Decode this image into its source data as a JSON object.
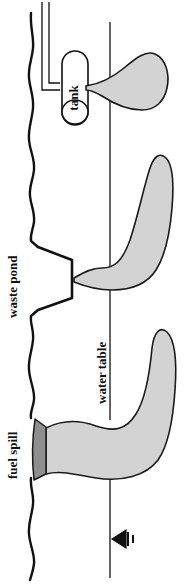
{
  "figure": {
    "orientation": "rotated-90-ccw",
    "background_color": "#ffffff",
    "labels": {
      "tank": "tank",
      "waste_pond": "waste pond",
      "water_table": "water table",
      "fuel_spill": "fuel spill"
    },
    "colors": {
      "plume_fill": "#d3d3d3",
      "spill_fill": "#8e8e8e",
      "line": "#111111",
      "background": "#ffffff"
    },
    "features": [
      {
        "name": "ground-surface",
        "type": "wavy-line",
        "description": "irregular land surface running the full height of the figure"
      },
      {
        "name": "vent-pipe",
        "type": "double-line",
        "description": "narrow pipe entering from the figure edge and hooking into the tank"
      },
      {
        "name": "tank",
        "type": "cylinder",
        "label": "tank",
        "description": "buried storage tank drawn as a rounded cylinder"
      },
      {
        "name": "waste-pond",
        "type": "trapezoid",
        "label": "waste pond",
        "description": "surface impoundment cross-section cut into the ground line"
      },
      {
        "name": "fuel-spill",
        "type": "wedge",
        "label": "fuel spill",
        "fill": "#8e8e8e",
        "description": "dark narrow wedge of spilled fuel at the ground surface"
      },
      {
        "name": "water-table",
        "type": "line",
        "label": "water table",
        "description": "thin straight line marking the saturated zone boundary"
      },
      {
        "name": "plume-tank",
        "type": "plume",
        "fill": "#d3d3d3",
        "description": "contaminant plume from the tank spreading across the water table"
      },
      {
        "name": "plume-waste-pond",
        "type": "plume",
        "fill": "#d3d3d3",
        "description": "contaminant plume leaking from the waste pond"
      },
      {
        "name": "plume-fuel-spill",
        "type": "plume",
        "fill": "#d3d3d3",
        "description": "large contaminant plume spreading from the fuel spill"
      },
      {
        "name": "water-table-symbol",
        "type": "symbol",
        "description": "standard inverted-triangle water table marker with bars"
      }
    ]
  }
}
